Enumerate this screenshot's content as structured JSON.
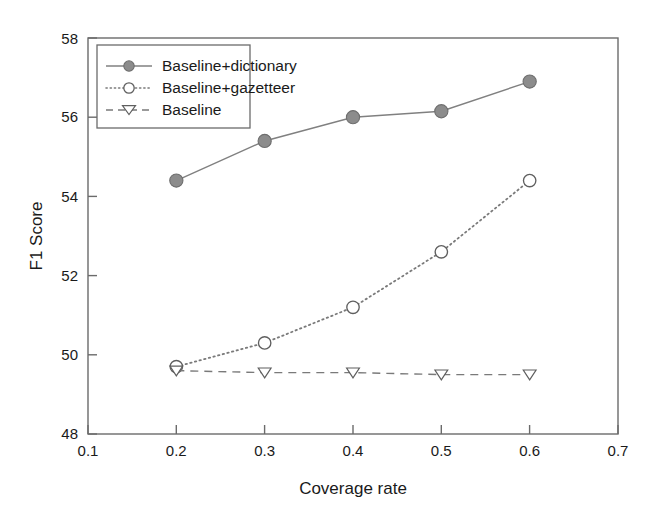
{
  "chart_data": {
    "type": "line",
    "title": "",
    "xlabel": "Coverage rate",
    "ylabel": "F1 Score",
    "x": [
      0.2,
      0.3,
      0.4,
      0.5,
      0.6
    ],
    "xlim": [
      0.1,
      0.7
    ],
    "ylim": [
      48,
      58
    ],
    "xticks": [
      "0.1",
      "0.2",
      "0.3",
      "0.4",
      "0.5",
      "0.6",
      "0.7"
    ],
    "yticks": [
      "48",
      "50",
      "52",
      "54",
      "56",
      "58"
    ],
    "grid": false,
    "legend_position": "upper left",
    "series": [
      {
        "name": "Baseline+dictionary",
        "values": [
          54.4,
          55.4,
          56.0,
          56.15,
          56.9
        ],
        "marker": "filled-circle",
        "linestyle": "solid",
        "color": "#808080"
      },
      {
        "name": "Baseline+gazetteer",
        "values": [
          49.7,
          50.3,
          51.2,
          52.6,
          54.4
        ],
        "marker": "open-circle",
        "linestyle": "dotted",
        "color": "#7a7a7a"
      },
      {
        "name": "Baseline",
        "values": [
          49.6,
          49.55,
          49.55,
          49.5,
          49.5
        ],
        "marker": "open-triangle-down",
        "linestyle": "dashed",
        "color": "#7a7a7a"
      }
    ]
  },
  "axes": {
    "xlabel": "Coverage rate",
    "ylabel": "F1 Score",
    "xtick_labels": [
      "0.1",
      "0.2",
      "0.3",
      "0.4",
      "0.5",
      "0.6",
      "0.7"
    ],
    "ytick_labels": [
      "48",
      "50",
      "52",
      "54",
      "56",
      "58"
    ]
  },
  "legend": {
    "entries": [
      {
        "label": "Baseline+dictionary"
      },
      {
        "label": "Baseline+gazetteer"
      },
      {
        "label": "Baseline"
      }
    ]
  }
}
